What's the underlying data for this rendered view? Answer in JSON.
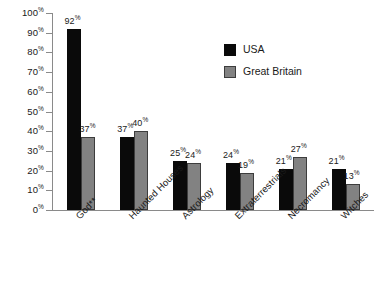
{
  "chart_data": {
    "type": "bar",
    "title": "",
    "subtitle": "",
    "xlabel": "",
    "ylabel": "",
    "ylim": [
      0,
      100
    ],
    "grid": false,
    "legend_position": "top-right",
    "categories": [
      "God**",
      "Haunted Houses",
      "Astrology",
      "Extraterrestrials",
      "Necromancy",
      "Witches"
    ],
    "y_ticks": [
      "0",
      "10",
      "20",
      "30",
      "40",
      "50",
      "60",
      "70",
      "80",
      "90",
      "100"
    ],
    "y_tick_suffix": "%",
    "value_suffix": "%",
    "series": [
      {
        "name": "USA",
        "color": "#0a0a0a",
        "values": [
          92,
          37,
          25,
          24,
          21,
          21
        ],
        "labels": [
          "92",
          "37",
          "25",
          "24",
          "21",
          "21"
        ]
      },
      {
        "name": "Great Britain",
        "color": "#828282",
        "values": [
          37,
          40,
          24,
          19,
          27,
          13
        ],
        "labels": [
          "37",
          "40",
          "24",
          "19",
          "27",
          "13"
        ]
      }
    ]
  },
  "legend": {
    "items": [
      {
        "label": "USA",
        "swatch": "usa"
      },
      {
        "label": "Great Britain",
        "swatch": "gb"
      }
    ]
  }
}
